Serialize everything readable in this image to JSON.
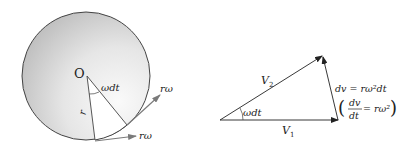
{
  "figure": {
    "left_panel": {
      "center_label": "O",
      "angle_label": "ωdt",
      "radius_label": "r",
      "velocity_label_1": "rω",
      "velocity_label_2": "rω"
    },
    "right_panel": {
      "v2_label": "V",
      "v2_sub": "2",
      "v1_label": "V",
      "v1_sub": "1",
      "angle_label": "ωdt",
      "dv_equation": "dv = rω²dt",
      "rate_num": "dv",
      "rate_den": "dt",
      "rate_rhs": "= rω²"
    },
    "colors": {
      "line": "#333333",
      "disk_light": "#f4f4f4",
      "disk_dark": "#bdbdbd",
      "arrow_grey": "#888888"
    }
  }
}
